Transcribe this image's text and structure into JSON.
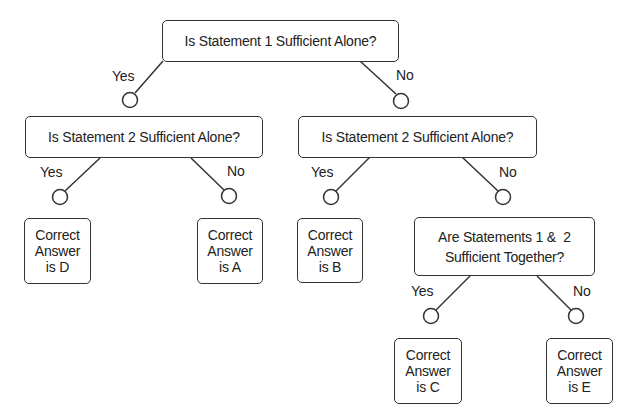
{
  "diagram": {
    "type": "decision-tree",
    "root": {
      "question": "Is Statement 1 Sufficient Alone?",
      "yes_label": "Yes",
      "no_label": "No"
    },
    "left_q2": {
      "question": "Is Statement 2 Sufficient Alone?",
      "yes_label": "Yes",
      "no_label": "No"
    },
    "right_q2": {
      "question": "Is Statement 2 Sufficient Alone?",
      "yes_label": "Yes",
      "no_label": "No"
    },
    "together": {
      "line1": "Are Statements 1 &  2",
      "line2": "Sufficient Together?",
      "yes_label": "Yes",
      "no_label": "No"
    },
    "answers": {
      "d": {
        "line1": "Correct",
        "line2": "Answer",
        "line3": "is D"
      },
      "a": {
        "line1": "Correct",
        "line2": "Answer",
        "line3": "is A"
      },
      "b": {
        "line1": "Correct",
        "line2": "Answer",
        "line3": "is B"
      },
      "c": {
        "line1": "Correct",
        "line2": "Answer",
        "line3": "is C"
      },
      "e": {
        "line1": "Correct",
        "line2": "Answer",
        "line3": "is E"
      }
    },
    "colors": {
      "stroke": "#333333",
      "text": "#222222",
      "background": "#ffffff"
    }
  }
}
